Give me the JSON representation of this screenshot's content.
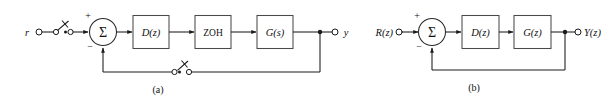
{
  "figure": {
    "background_color": "#ffffff",
    "line_color": "#1a1a1a",
    "block_stroke_color": "#4a4a4a",
    "panels": [
      {
        "id": "a",
        "caption": "(a)",
        "input_label": "r",
        "output_label": "y",
        "sum_label": "Σ",
        "sum_plus": "+",
        "sum_minus": "−",
        "blocks": [
          {
            "name": "controller",
            "label_main": "D",
            "label_arg": "(z)",
            "label_full": "D(z)"
          },
          {
            "name": "zero-order-hold",
            "label_main": "ZOH",
            "label_arg": "",
            "label_full": "ZOH"
          },
          {
            "name": "plant",
            "label_main": "G",
            "label_arg": "(s)",
            "label_full": "G(s)"
          }
        ],
        "switches": [
          {
            "name": "input-sampler-switch"
          },
          {
            "name": "feedback-sampler-switch"
          }
        ]
      },
      {
        "id": "b",
        "caption": "(b)",
        "input_label": "R(z)",
        "output_label": "Y(z)",
        "sum_label": "Σ",
        "sum_plus": "+",
        "sum_minus": "−",
        "blocks": [
          {
            "name": "controller",
            "label_main": "D",
            "label_arg": "(z)",
            "label_full": "D(z)"
          },
          {
            "name": "plant",
            "label_main": "G",
            "label_arg": "(z)",
            "label_full": "G(z)"
          }
        ],
        "switches": []
      }
    ]
  }
}
